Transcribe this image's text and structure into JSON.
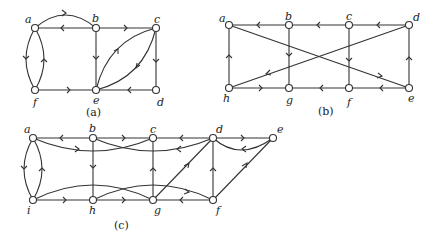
{
  "graphs": [
    {
      "caption": "(a)",
      "nodes": {
        "a": "a",
        "b": "b",
        "c": "c",
        "d": "d",
        "e": "e",
        "f": "f"
      },
      "edges": [
        [
          "a",
          "b",
          "curved-top"
        ],
        [
          "b",
          "a",
          "straight"
        ],
        [
          "b",
          "c",
          "straight"
        ],
        [
          "b",
          "e",
          "straight"
        ],
        [
          "c",
          "d",
          "straight"
        ],
        [
          "d",
          "e",
          "straight"
        ],
        [
          "f",
          "e",
          "straight"
        ],
        [
          "a",
          "f",
          "curved-left"
        ],
        [
          "f",
          "a",
          "curved-right"
        ],
        [
          "e",
          "c",
          "curved"
        ],
        [
          "c",
          "e",
          "curved"
        ]
      ]
    },
    {
      "caption": "(b)",
      "nodes": {
        "a": "a",
        "b": "b",
        "c": "c",
        "d": "d",
        "e": "e",
        "f": "f",
        "g": "g",
        "h": "h"
      },
      "edges": [
        [
          "b",
          "a"
        ],
        [
          "c",
          "b"
        ],
        [
          "d",
          "c"
        ],
        [
          "b",
          "g"
        ],
        [
          "c",
          "f"
        ],
        [
          "h",
          "a"
        ],
        [
          "e",
          "d"
        ],
        [
          "h",
          "g"
        ],
        [
          "f",
          "g"
        ],
        [
          "e",
          "f"
        ],
        [
          "a",
          "e"
        ],
        [
          "d",
          "h"
        ]
      ]
    },
    {
      "caption": "(c)",
      "nodes": {
        "a": "a",
        "b": "b",
        "c": "c",
        "d": "d",
        "e": "e",
        "f": "f",
        "g": "g",
        "h": "h",
        "i": "i"
      },
      "edges": [
        [
          "b",
          "a"
        ],
        [
          "b",
          "c"
        ],
        [
          "d",
          "c"
        ],
        [
          "a",
          "c",
          "curved"
        ],
        [
          "d",
          "b",
          "curved"
        ],
        [
          "a",
          "i",
          "curved-left"
        ],
        [
          "i",
          "a",
          "curved-right"
        ],
        [
          "b",
          "h"
        ],
        [
          "g",
          "c"
        ],
        [
          "i",
          "h"
        ],
        [
          "h",
          "g"
        ],
        [
          "f",
          "g"
        ],
        [
          "i",
          "g",
          "curved"
        ],
        [
          "h",
          "f",
          "curved"
        ],
        [
          "g",
          "d"
        ],
        [
          "f",
          "d"
        ],
        [
          "f",
          "e"
        ],
        [
          "d",
          "e"
        ],
        [
          "e",
          "d",
          "curved"
        ]
      ]
    }
  ]
}
